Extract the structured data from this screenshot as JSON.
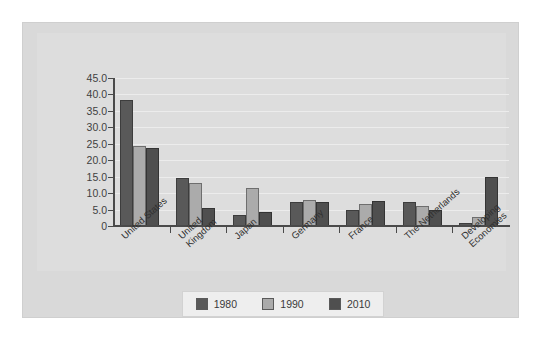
{
  "chart_data": {
    "type": "bar",
    "title": "",
    "subtitle": "",
    "xlabel": "",
    "ylabel": "",
    "ylim": [
      0,
      45
    ],
    "ytick_labels": [
      "45.0",
      "40.0",
      "35.0",
      "30.0",
      "25.0",
      "20.0",
      "15.0",
      "10.0",
      "5.0",
      "0"
    ],
    "ytick_values": [
      45,
      40,
      35,
      30,
      25,
      20,
      15,
      10,
      5,
      0
    ],
    "grid": true,
    "legend_position": "bottom-center",
    "categories": [
      "United States",
      "United\nKingdom",
      "Japan",
      "Germany",
      "France",
      "The Netherlands",
      "Developing\nEconomies"
    ],
    "series": [
      {
        "name": "1980",
        "color": "#595959",
        "values": [
          38.3,
          14.6,
          3.5,
          7.2,
          5.0,
          7.3,
          0.8
        ]
      },
      {
        "name": "1990",
        "color": "#ababab",
        "values": [
          24.3,
          13.1,
          11.5,
          8.0,
          6.7,
          6.2,
          2.8
        ]
      },
      {
        "name": "2010",
        "color": "#4f4f4f",
        "values": [
          23.7,
          5.6,
          4.3,
          7.4,
          7.5,
          4.8,
          15.0
        ]
      }
    ]
  },
  "legend": {
    "items": [
      {
        "label": "1980",
        "color": "#595959"
      },
      {
        "label": "1990",
        "color": "#ababab"
      },
      {
        "label": "2010",
        "color": "#4f4f4f"
      }
    ]
  },
  "colors": {
    "page_background": "#ffffff",
    "plate_background": "#d9d9d9",
    "chart_background": "#dddddd",
    "gridline": "#ececec",
    "axis": "#4a4a4a",
    "legend_background": "#eeeeee",
    "text": "#2f2f2f"
  }
}
